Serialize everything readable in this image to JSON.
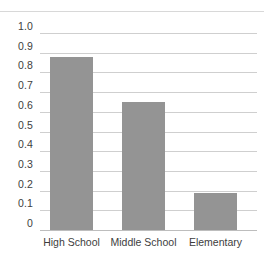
{
  "chart_data": {
    "type": "bar",
    "title": "",
    "subtitle": "",
    "xlabel": "",
    "ylabel": "",
    "categories": [
      "High School",
      "Middle School",
      "Elementary"
    ],
    "values": [
      0.88,
      0.65,
      0.19
    ],
    "series": [
      {
        "name": "",
        "values": [
          0.88,
          0.65,
          0.19
        ]
      }
    ],
    "ylim": [
      0,
      1.0
    ],
    "ytick_labels": [
      "1.0",
      "0.9",
      "0.8",
      "0.7",
      "0.6",
      "0.5",
      "0.4",
      "0.3",
      "0.2",
      "0.1",
      "0"
    ],
    "ytick_values": [
      1.0,
      0.9,
      0.8,
      0.7,
      0.6,
      0.5,
      0.4,
      0.3,
      0.2,
      0.1,
      0
    ],
    "grid": true,
    "grid_axis": "y",
    "legend": false,
    "legend_position": "none",
    "annotations": [],
    "colors": {
      "bar_fill": "#949494",
      "gridline": "#cfcfcf",
      "baseline": "#bdbdbd",
      "tick_label_text": "#3d3d3d",
      "background": "#ffffff"
    }
  }
}
